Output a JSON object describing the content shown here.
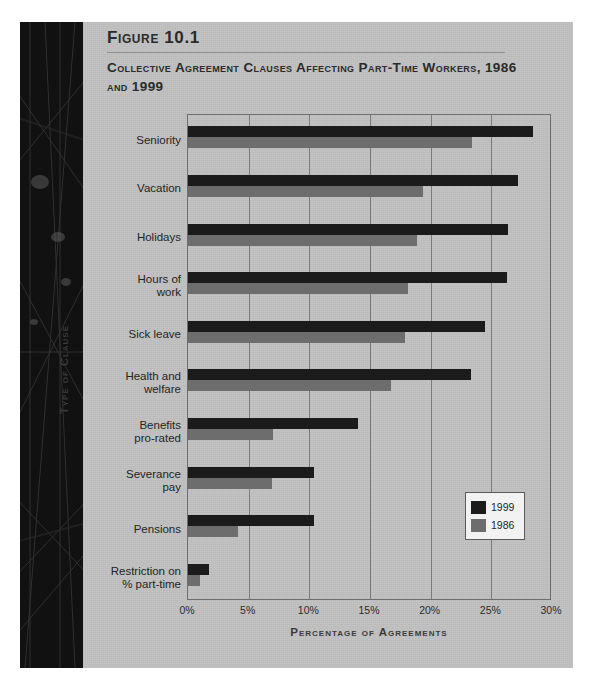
{
  "figure": {
    "label": "Figure 10.1",
    "title": "Collective Agreement Clauses Affecting Part-Time Workers, 1986 and 1999"
  },
  "chart_data": {
    "type": "bar",
    "orientation": "horizontal",
    "title": "Collective Agreement Clauses Affecting Part-Time Workers, 1986 and 1999",
    "xlabel": "Percentage of Agreements",
    "ylabel": "Type of Clause",
    "xlim": [
      0,
      30
    ],
    "xticks": [
      0,
      5,
      10,
      15,
      20,
      25,
      30
    ],
    "xticklabels": [
      "0%",
      "5%",
      "10%",
      "15%",
      "20%",
      "25%",
      "30%"
    ],
    "grid": "vertical",
    "legend_position": "lower-right-inside",
    "categories": [
      "Seniority",
      "Vacation",
      "Holidays",
      "Hours of work",
      "Sick leave",
      "Health and welfare",
      "Benefits pro-rated",
      "Severance pay",
      "Pensions",
      "Restriction on % part-time"
    ],
    "category_lines": [
      [
        "Seniority"
      ],
      [
        "Vacation"
      ],
      [
        "Holidays"
      ],
      [
        "Hours of",
        "work"
      ],
      [
        "Sick leave"
      ],
      [
        "Health and",
        "welfare"
      ],
      [
        "Benefits",
        "pro-rated"
      ],
      [
        "Severance",
        "pay"
      ],
      [
        "Pensions"
      ],
      [
        "Restriction on",
        "% part-time"
      ]
    ],
    "series": [
      {
        "name": "1999",
        "color": "#1b1b1b",
        "values": [
          28.4,
          27.2,
          26.4,
          26.3,
          24.5,
          23.3,
          14.0,
          10.4,
          10.4,
          1.7
        ]
      },
      {
        "name": "1986",
        "color": "#6d6d6d",
        "values": [
          23.4,
          19.4,
          18.9,
          18.1,
          17.9,
          16.7,
          7.0,
          6.9,
          4.1,
          1.0
        ]
      }
    ]
  },
  "legend": {
    "entries": [
      {
        "label": "1999",
        "color": "#1b1b1b"
      },
      {
        "label": "1986",
        "color": "#6d6d6d"
      }
    ]
  },
  "colors": {
    "page": "#c0c0c0",
    "spine": "#141414",
    "bar_1999": "#1b1b1b",
    "bar_1986": "#6d6d6d",
    "frame": "#6e6e6e",
    "grid": "#7a7a7a"
  }
}
